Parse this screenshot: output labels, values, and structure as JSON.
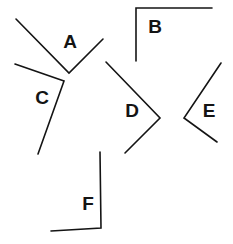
{
  "angles": [
    {
      "label": "A",
      "points": [
        [
          16,
          19
        ],
        [
          69,
          73
        ],
        [
          103,
          39
        ]
      ],
      "label_pos": [
        70,
        43
      ]
    },
    {
      "label": "B",
      "points": [
        [
          136,
          61
        ],
        [
          136,
          8
        ],
        [
          212,
          8
        ]
      ],
      "label_pos": [
        155,
        28
      ]
    },
    {
      "label": "C",
      "points": [
        [
          15,
          64
        ],
        [
          64,
          81
        ],
        [
          38,
          154
        ]
      ],
      "label_pos": [
        42,
        99
      ]
    },
    {
      "label": "D",
      "points": [
        [
          106,
          62
        ],
        [
          160,
          118
        ],
        [
          125,
          153
        ]
      ],
      "label_pos": [
        132,
        112
      ]
    },
    {
      "label": "E",
      "points": [
        [
          221,
          63
        ],
        [
          184,
          118
        ],
        [
          217,
          142
        ]
      ],
      "label_pos": [
        209,
        112
      ]
    },
    {
      "label": "F",
      "points": [
        [
          100,
          152
        ],
        [
          101,
          228
        ],
        [
          51,
          231
        ]
      ],
      "label_pos": [
        88,
        205
      ]
    }
  ],
  "colors": {
    "line": "#141414",
    "background": "#ffffff"
  }
}
